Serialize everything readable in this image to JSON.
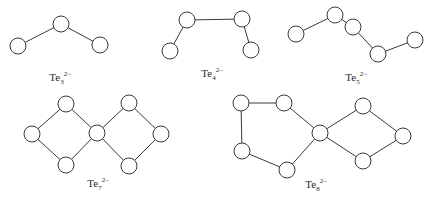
{
  "diagram": {
    "colors": {
      "line": "#3a3a3a",
      "atom_fill": "#ffffff",
      "text": "#2a2a2a"
    },
    "atom_radius": 8,
    "structures": [
      {
        "id": "te3",
        "label": {
          "element": "Te",
          "subscript": "3",
          "charge": "2-",
          "x": 60,
          "y": 70
        },
        "atoms": [
          [
            18,
            46
          ],
          [
            61,
            24
          ],
          [
            100,
            45
          ]
        ],
        "bonds": [
          [
            0,
            1
          ],
          [
            1,
            2
          ]
        ]
      },
      {
        "id": "te4",
        "label": {
          "element": "Te",
          "subscript": "4",
          "charge": "2-",
          "x": 212,
          "y": 66
        },
        "atoms": [
          [
            170,
            51
          ],
          [
            187,
            20
          ],
          [
            242,
            19
          ],
          [
            251,
            50
          ]
        ],
        "bonds": [
          [
            0,
            1
          ],
          [
            1,
            2
          ],
          [
            2,
            3
          ]
        ]
      },
      {
        "id": "te5",
        "label": {
          "element": "Te",
          "subscript": "5",
          "charge": "2-",
          "x": 356,
          "y": 70
        },
        "atoms": [
          [
            296,
            34
          ],
          [
            335,
            15
          ],
          [
            353,
            27
          ],
          [
            378,
            54
          ],
          [
            415,
            40
          ]
        ],
        "bonds": [
          [
            0,
            1
          ],
          [
            1,
            2
          ],
          [
            2,
            3
          ],
          [
            3,
            4
          ]
        ]
      },
      {
        "id": "te7",
        "label": {
          "element": "Te",
          "subscript": "7",
          "charge": "2-",
          "x": 98,
          "y": 176
        },
        "atoms": [
          [
            32,
            134
          ],
          [
            66,
            104
          ],
          [
            97,
            133
          ],
          [
            66,
            165
          ],
          [
            129,
            103
          ],
          [
            161,
            134
          ],
          [
            129,
            166
          ]
        ],
        "bonds": [
          [
            0,
            1
          ],
          [
            1,
            2
          ],
          [
            2,
            3
          ],
          [
            3,
            0
          ],
          [
            2,
            4
          ],
          [
            4,
            5
          ],
          [
            5,
            6
          ],
          [
            6,
            2
          ]
        ]
      },
      {
        "id": "te8",
        "label": {
          "element": "Te",
          "subscript": "8",
          "charge": "2-",
          "x": 316,
          "y": 177
        },
        "atoms": [
          [
            241,
            103
          ],
          [
            284,
            103
          ],
          [
            320,
            133
          ],
          [
            287,
            170
          ],
          [
            242,
            151
          ],
          [
            363,
            106
          ],
          [
            403,
            136
          ],
          [
            363,
            161
          ]
        ],
        "bonds": [
          [
            0,
            1
          ],
          [
            1,
            2
          ],
          [
            2,
            3
          ],
          [
            3,
            4
          ],
          [
            4,
            0
          ],
          [
            2,
            5
          ],
          [
            5,
            6
          ],
          [
            6,
            7
          ],
          [
            7,
            2
          ]
        ]
      }
    ]
  }
}
